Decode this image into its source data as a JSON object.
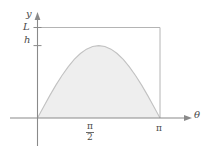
{
  "figure": {
    "background_color": "#ffffff",
    "axis_color": "#8a8a8a",
    "guide_color": "#b4b4b4",
    "curve_color": "#c2c2c2",
    "fill_color": "#eeeeee"
  },
  "labels": {
    "y_axis": "y",
    "x_axis": "θ",
    "L": "L",
    "h": "h",
    "pi": "π",
    "pi_half_numerator": "π",
    "pi_half_denominator": "2"
  },
  "chart_data": {
    "type": "area",
    "title": "",
    "subtitle": "",
    "xlabel": "θ",
    "ylabel": "y",
    "xlim": [
      0,
      3.14159
    ],
    "ylim": [
      0,
      1.25
    ],
    "grid": false,
    "legend": null,
    "xticks": [
      0,
      1.5708,
      3.14159
    ],
    "xticklabels": [
      "",
      "π/2",
      "π"
    ],
    "yticks": [
      1.0,
      1.25
    ],
    "yticklabels": [
      "h",
      "L"
    ],
    "annotations": [
      {
        "text": "L",
        "value": 1.25,
        "kind": "horizontal-reference-line",
        "note": "rectangle top edge spanning 0 to π"
      },
      {
        "text": "h",
        "value": 1.0,
        "kind": "y-tick",
        "note": "peak height of the shaded arch"
      }
    ],
    "series": [
      {
        "name": "h·sin(θ)",
        "kind": "area",
        "fill": true,
        "x": [
          0,
          0.1571,
          0.3142,
          0.4712,
          0.6283,
          0.7854,
          0.9425,
          1.0996,
          1.2566,
          1.4137,
          1.5708,
          1.7279,
          1.885,
          2.042,
          2.1991,
          2.3562,
          2.5133,
          2.6704,
          2.8274,
          2.9845,
          3.14159
        ],
        "values": [
          0.0,
          0.1564,
          0.309,
          0.454,
          0.5878,
          0.7071,
          0.809,
          0.891,
          0.9511,
          0.9877,
          1.0,
          0.9877,
          0.9511,
          0.891,
          0.809,
          0.7071,
          0.5878,
          0.454,
          0.309,
          0.1564,
          0.0
        ]
      },
      {
        "name": "bounding rectangle of height L",
        "kind": "outline",
        "x": [
          0,
          3.14159,
          3.14159
        ],
        "values": [
          1.25,
          1.25,
          0.0
        ]
      }
    ]
  }
}
